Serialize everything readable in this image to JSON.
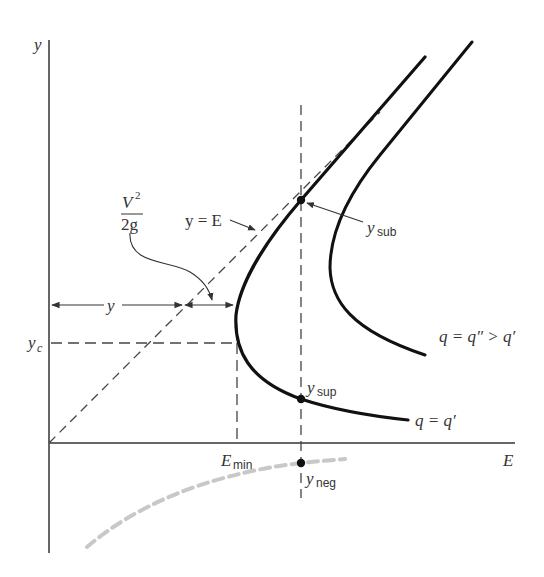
{
  "diagram": {
    "axes": {
      "y_label": "y",
      "x_label": "E"
    },
    "labels": {
      "velocity_head_num": "V",
      "velocity_head_exp": "2",
      "velocity_head_den": "2g",
      "y_equals_E": "y = E",
      "depth_y": "y",
      "y_c_main": "y",
      "y_c_sub": "c",
      "e_min_main": "E",
      "e_min_sub": "min",
      "y_sub_main": "y",
      "y_sub_sub": "sub",
      "y_sup_main": "y",
      "y_sup_sub": "sup",
      "y_neg_main": "y",
      "y_neg_sub": "neg",
      "curve_q_prime": "q = q′",
      "curve_q_double_prime": "q = q″ > q′"
    },
    "colors": {
      "curve": "#111111",
      "axis": "#555555",
      "dashed": "#444444",
      "negative_branch": "#c8c8c8",
      "text": "#333333"
    },
    "curves": [
      {
        "name": "q = q′",
        "description": "specific energy curve for flow q′, nose at E_min, y_c"
      },
      {
        "name": "q = q″ > q′",
        "description": "specific energy curve for larger flow q″, shifted right"
      },
      {
        "name": "negative branch",
        "description": "physically meaningless negative depth branch (gray dashed)"
      }
    ],
    "points": [
      {
        "name": "y_sub",
        "description": "subcritical depth at given E"
      },
      {
        "name": "y_sup",
        "description": "supercritical depth at given E"
      },
      {
        "name": "y_neg",
        "description": "negative root at given E"
      }
    ]
  }
}
